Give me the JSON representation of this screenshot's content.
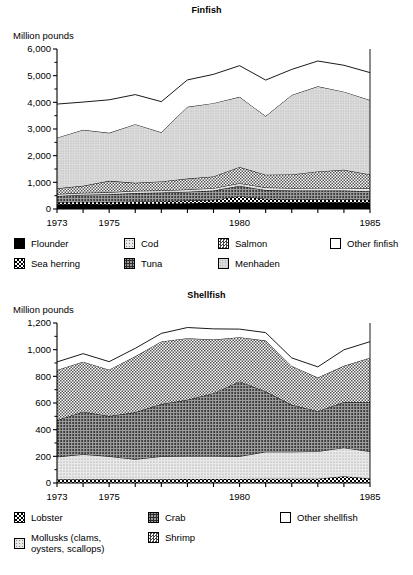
{
  "charts": [
    {
      "id": "finfish",
      "title": "Finfish",
      "ylabel": "Million pounds",
      "chart_type": "area",
      "ylim": [
        0,
        6000
      ],
      "yticks": [
        0,
        1000,
        2000,
        3000,
        4000,
        5000,
        6000
      ],
      "ytick_labels": [
        "0",
        "1,000",
        "2,000",
        "3,000",
        "4,000",
        "5,000",
        "6,000"
      ],
      "yminor_step": 500,
      "xlim": [
        1973,
        1985
      ],
      "xticks": [
        1973,
        1974,
        1975,
        1976,
        1977,
        1978,
        1979,
        1980,
        1981,
        1982,
        1983,
        1984,
        1985
      ],
      "xtick_labels": [
        {
          "x": 1973,
          "label": "1973"
        },
        {
          "x": 1975,
          "label": "1975"
        },
        {
          "x": 1980,
          "label": "1980"
        },
        {
          "x": 1985,
          "label": "1985"
        }
      ],
      "series": [
        {
          "name": "Flounder",
          "pattern": "sw-solid",
          "values": [
            175,
            185,
            180,
            195,
            200,
            215,
            230,
            250,
            245,
            240,
            250,
            255,
            245
          ]
        },
        {
          "name": "Sea herring",
          "pattern": "sw-checker-dark",
          "values": [
            80,
            85,
            80,
            85,
            95,
            100,
            110,
            230,
            135,
            120,
            110,
            105,
            100
          ]
        },
        {
          "name": "Tuna",
          "pattern": "sw-dots-dense",
          "values": [
            235,
            260,
            290,
            320,
            320,
            330,
            350,
            390,
            330,
            330,
            330,
            330,
            320
          ]
        },
        {
          "name": "Cod",
          "pattern": "sw-dots-light",
          "values": [
            70,
            75,
            75,
            80,
            80,
            85,
            90,
            95,
            95,
            95,
            100,
            100,
            100
          ]
        },
        {
          "name": "Salmon",
          "pattern": "sw-checker-med",
          "values": [
            215,
            265,
            430,
            300,
            340,
            410,
            440,
            610,
            480,
            510,
            620,
            680,
            530
          ]
        },
        {
          "name": "Menhaden",
          "pattern": "sw-dots-fine",
          "values": [
            1900,
            2100,
            1800,
            2200,
            1840,
            2690,
            2750,
            2630,
            2200,
            2980,
            3190,
            2930,
            2790
          ]
        },
        {
          "name": "Other finfish",
          "pattern": "sw-white",
          "values": [
            1260,
            1040,
            1240,
            1110,
            1150,
            1010,
            1080,
            1170,
            1350,
            960,
            950,
            990,
            1030
          ]
        }
      ]
    },
    {
      "id": "shellfish",
      "title": "Shellfish",
      "ylabel": "Million pounds",
      "chart_type": "area",
      "ylim": [
        0,
        1200
      ],
      "yticks": [
        0,
        200,
        400,
        600,
        800,
        1000,
        1200
      ],
      "ytick_labels": [
        "0",
        "200",
        "400",
        "600",
        "800",
        "1,000",
        "1,200"
      ],
      "yminor_step": 100,
      "xlim": [
        1973,
        1985
      ],
      "xticks": [
        1973,
        1974,
        1975,
        1976,
        1977,
        1978,
        1979,
        1980,
        1981,
        1982,
        1983,
        1984,
        1985
      ],
      "xtick_labels": [
        {
          "x": 1973,
          "label": "1973"
        },
        {
          "x": 1975,
          "label": "1975"
        },
        {
          "x": 1980,
          "label": "1980"
        },
        {
          "x": 1985,
          "label": "1985"
        }
      ],
      "series": [
        {
          "name": "Lobster",
          "pattern": "sw-checker-dark",
          "values": [
            28,
            28,
            28,
            26,
            28,
            30,
            30,
            30,
            32,
            32,
            32,
            50,
            34
          ]
        },
        {
          "name": "Mollusks (clams, oysters, scallops)",
          "pattern": "sw-dots-light",
          "values": [
            168,
            187,
            172,
            152,
            172,
            172,
            172,
            170,
            202,
            202,
            205,
            215,
            202
          ]
        },
        {
          "name": "Crab",
          "pattern": "sw-dots-dense",
          "values": [
            274,
            320,
            302,
            352,
            392,
            422,
            472,
            562,
            452,
            352,
            302,
            342,
            372
          ]
        },
        {
          "name": "Shrimp",
          "pattern": "sw-checker-med",
          "values": [
            378,
            375,
            348,
            420,
            470,
            462,
            402,
            332,
            382,
            292,
            252,
            272,
            332
          ]
        },
        {
          "name": "Other shellfish",
          "pattern": "sw-white",
          "values": [
            60,
            60,
            60,
            60,
            60,
            80,
            80,
            60,
            60,
            60,
            80,
            120,
            120
          ]
        }
      ]
    }
  ],
  "chart_data": [
    {
      "type": "area",
      "title": "Finfish",
      "xlabel": "",
      "ylabel": "Million pounds",
      "ylim": [
        0,
        6000
      ],
      "grid": false,
      "legend_position": "below",
      "x": [
        1973,
        1974,
        1975,
        1976,
        1977,
        1978,
        1979,
        1980,
        1981,
        1982,
        1983,
        1984,
        1985
      ],
      "tick_labels_x": [
        "1973",
        "1975",
        "1980",
        "1985"
      ],
      "tick_labels_y": [
        "0",
        "1,000",
        "2,000",
        "3,000",
        "4,000",
        "5,000",
        "6,000"
      ],
      "stacked": true,
      "series": [
        {
          "name": "Flounder",
          "values": [
            175,
            185,
            180,
            195,
            200,
            215,
            230,
            250,
            245,
            240,
            250,
            255,
            245
          ]
        },
        {
          "name": "Sea herring",
          "values": [
            80,
            85,
            80,
            85,
            95,
            100,
            110,
            230,
            135,
            120,
            110,
            105,
            100
          ]
        },
        {
          "name": "Tuna",
          "values": [
            235,
            260,
            290,
            320,
            320,
            330,
            350,
            390,
            330,
            330,
            330,
            330,
            320
          ]
        },
        {
          "name": "Cod",
          "values": [
            70,
            75,
            75,
            80,
            80,
            85,
            90,
            95,
            95,
            95,
            100,
            100,
            100
          ]
        },
        {
          "name": "Salmon",
          "values": [
            215,
            265,
            430,
            300,
            340,
            410,
            440,
            610,
            480,
            510,
            620,
            680,
            530
          ]
        },
        {
          "name": "Menhaden",
          "values": [
            1900,
            2100,
            1800,
            2200,
            1840,
            2690,
            2750,
            2630,
            2200,
            2980,
            3190,
            2930,
            2790
          ]
        },
        {
          "name": "Other finfish",
          "values": [
            1260,
            1040,
            1240,
            1110,
            1150,
            1010,
            1080,
            1170,
            1350,
            960,
            950,
            990,
            1030
          ]
        }
      ],
      "stack_totals": [
        3935,
        4010,
        3955,
        4290,
        4025,
        4825,
        5050,
        5375,
        4895,
        5035,
        5550,
        5390,
        5115
      ]
    },
    {
      "type": "area",
      "title": "Shellfish",
      "xlabel": "",
      "ylabel": "Million pounds",
      "ylim": [
        0,
        1200
      ],
      "grid": false,
      "legend_position": "below",
      "x": [
        1973,
        1974,
        1975,
        1976,
        1977,
        1978,
        1979,
        1980,
        1981,
        1982,
        1983,
        1984,
        1985
      ],
      "tick_labels_x": [
        "1973",
        "1975",
        "1980",
        "1985"
      ],
      "tick_labels_y": [
        "0",
        "200",
        "400",
        "600",
        "800",
        "1,000",
        "1,200"
      ],
      "stacked": true,
      "series": [
        {
          "name": "Lobster",
          "values": [
            28,
            28,
            28,
            26,
            28,
            30,
            30,
            30,
            32,
            32,
            32,
            50,
            34
          ]
        },
        {
          "name": "Mollusks (clams, oysters, scallops)",
          "values": [
            168,
            187,
            172,
            152,
            172,
            172,
            172,
            170,
            202,
            202,
            205,
            215,
            202
          ]
        },
        {
          "name": "Crab",
          "values": [
            274,
            320,
            302,
            352,
            392,
            422,
            472,
            562,
            452,
            352,
            302,
            342,
            372
          ]
        },
        {
          "name": "Shrimp",
          "values": [
            378,
            375,
            348,
            420,
            470,
            462,
            402,
            332,
            382,
            292,
            252,
            272,
            332
          ]
        },
        {
          "name": "Other shellfish",
          "values": [
            60,
            60,
            60,
            60,
            60,
            80,
            80,
            60,
            60,
            60,
            80,
            120,
            120
          ]
        }
      ],
      "stack_totals": [
        908,
        970,
        910,
        1010,
        1122,
        1166,
        1156,
        1154,
        1128,
        938,
        871,
        999,
        1060
      ]
    }
  ],
  "finfish_legend": {
    "row1": [
      {
        "label": "Flounder",
        "pattern": "sw-solid"
      },
      {
        "label": "Cod",
        "pattern": "sw-dots-light"
      },
      {
        "label": "Salmon",
        "pattern": "sw-checker-med"
      },
      {
        "label": "Other finfish",
        "pattern": "sw-white"
      }
    ],
    "row2": [
      {
        "label": "Sea herring",
        "pattern": "sw-checker-dark"
      },
      {
        "label": "Tuna",
        "pattern": "sw-dots-dense"
      },
      {
        "label": "Menhaden",
        "pattern": "sw-dots-fine"
      }
    ]
  },
  "shellfish_legend": {
    "row1": [
      {
        "label": "Lobster",
        "pattern": "sw-checker-dark"
      },
      {
        "label": "Crab",
        "pattern": "sw-dots-dense"
      },
      {
        "label": "Other shellfish",
        "pattern": "sw-white"
      }
    ],
    "row2": [
      {
        "label": "Mollusks (clams, oysters, scallops)",
        "pattern": "sw-dots-light"
      },
      {
        "label": "Shrimp",
        "pattern": "sw-checker-med"
      }
    ]
  }
}
